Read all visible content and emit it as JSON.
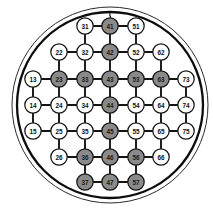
{
  "figure": {
    "name": "wafer-site-map",
    "background_color": "#ffffff",
    "wafer": {
      "center_x": 110,
      "center_y": 105,
      "outer_radius": 98,
      "inner_radius": 93,
      "outer_stroke_color": "#2b2b2b",
      "inner_stroke_color": "#0d0d0d"
    },
    "colors": {
      "node_highlight_fill": "#8a8a8a",
      "node_plain_fill": "#ffffff",
      "node_stroke": "#141414",
      "edge_stroke": "#141414",
      "label_color": "#111111"
    },
    "node_radius": 8.2,
    "grid": {
      "columns_x": [
        33,
        59,
        85,
        110,
        136,
        161,
        186
      ],
      "rows_y": [
        26,
        52,
        79,
        105,
        131,
        157,
        182
      ]
    },
    "notch": {
      "x": 110,
      "y_top": 11,
      "y_bottom": 22
    }
  },
  "chart_data": {
    "type": "scatter",
    "title": "",
    "xlabel": "",
    "ylabel": "",
    "legend": [
      {
        "label": "shaded site",
        "fill": "#8a8a8a"
      },
      {
        "label": "unshaded site",
        "fill": "#ffffff"
      }
    ],
    "columns": [
      1,
      2,
      3,
      4,
      5,
      6,
      7
    ],
    "rows": [
      1,
      2,
      3,
      4,
      5,
      6,
      7
    ],
    "nodes": [
      {
        "id": "31",
        "col": 3,
        "row": 1,
        "x": 85,
        "y": 26,
        "shaded": false
      },
      {
        "id": "41",
        "col": 4,
        "row": 1,
        "x": 110,
        "y": 26,
        "shaded": true
      },
      {
        "id": "51",
        "col": 5,
        "row": 1,
        "x": 136,
        "y": 26,
        "shaded": false
      },
      {
        "id": "22",
        "col": 2,
        "row": 2,
        "x": 59,
        "y": 52,
        "shaded": false
      },
      {
        "id": "32",
        "col": 3,
        "row": 2,
        "x": 85,
        "y": 52,
        "shaded": false
      },
      {
        "id": "42",
        "col": 4,
        "row": 2,
        "x": 110,
        "y": 52,
        "shaded": true
      },
      {
        "id": "52",
        "col": 5,
        "row": 2,
        "x": 136,
        "y": 52,
        "shaded": false
      },
      {
        "id": "62",
        "col": 6,
        "row": 2,
        "x": 161,
        "y": 52,
        "shaded": false
      },
      {
        "id": "13",
        "col": 1,
        "row": 3,
        "x": 33,
        "y": 79,
        "shaded": false
      },
      {
        "id": "23",
        "col": 2,
        "row": 3,
        "x": 59,
        "y": 79,
        "shaded": true
      },
      {
        "id": "33",
        "col": 3,
        "row": 3,
        "x": 85,
        "y": 79,
        "shaded": true
      },
      {
        "id": "43",
        "col": 4,
        "row": 3,
        "x": 110,
        "y": 79,
        "shaded": true
      },
      {
        "id": "53",
        "col": 5,
        "row": 3,
        "x": 136,
        "y": 79,
        "shaded": true
      },
      {
        "id": "63",
        "col": 6,
        "row": 3,
        "x": 161,
        "y": 79,
        "shaded": true
      },
      {
        "id": "73",
        "col": 7,
        "row": 3,
        "x": 186,
        "y": 79,
        "shaded": false
      },
      {
        "id": "14",
        "col": 1,
        "row": 4,
        "x": 33,
        "y": 105,
        "shaded": false
      },
      {
        "id": "24",
        "col": 2,
        "row": 4,
        "x": 59,
        "y": 105,
        "shaded": false
      },
      {
        "id": "34",
        "col": 3,
        "row": 4,
        "x": 85,
        "y": 105,
        "shaded": false
      },
      {
        "id": "44",
        "col": 4,
        "row": 4,
        "x": 110,
        "y": 105,
        "shaded": true
      },
      {
        "id": "54",
        "col": 5,
        "row": 4,
        "x": 136,
        "y": 105,
        "shaded": false
      },
      {
        "id": "64",
        "col": 6,
        "row": 4,
        "x": 161,
        "y": 105,
        "shaded": false
      },
      {
        "id": "74",
        "col": 7,
        "row": 4,
        "x": 186,
        "y": 105,
        "shaded": false
      },
      {
        "id": "15",
        "col": 1,
        "row": 5,
        "x": 33,
        "y": 131,
        "shaded": false
      },
      {
        "id": "25",
        "col": 2,
        "row": 5,
        "x": 59,
        "y": 131,
        "shaded": false
      },
      {
        "id": "35",
        "col": 3,
        "row": 5,
        "x": 85,
        "y": 131,
        "shaded": false
      },
      {
        "id": "45",
        "col": 4,
        "row": 5,
        "x": 110,
        "y": 131,
        "shaded": true
      },
      {
        "id": "55",
        "col": 5,
        "row": 5,
        "x": 136,
        "y": 131,
        "shaded": false
      },
      {
        "id": "65",
        "col": 6,
        "row": 5,
        "x": 161,
        "y": 131,
        "shaded": false
      },
      {
        "id": "75",
        "col": 7,
        "row": 5,
        "x": 186,
        "y": 131,
        "shaded": false
      },
      {
        "id": "26",
        "col": 2,
        "row": 6,
        "x": 59,
        "y": 157,
        "shaded": false
      },
      {
        "id": "36",
        "col": 3,
        "row": 6,
        "x": 85,
        "y": 157,
        "shaded": true
      },
      {
        "id": "46",
        "col": 4,
        "row": 6,
        "x": 110,
        "y": 157,
        "shaded": true
      },
      {
        "id": "56",
        "col": 5,
        "row": 6,
        "x": 136,
        "y": 157,
        "shaded": true
      },
      {
        "id": "66",
        "col": 6,
        "row": 6,
        "x": 161,
        "y": 157,
        "shaded": false
      },
      {
        "id": "37",
        "col": 3,
        "row": 7,
        "x": 85,
        "y": 182,
        "shaded": true
      },
      {
        "id": "47",
        "col": 4,
        "row": 7,
        "x": 110,
        "y": 182,
        "shaded": true
      },
      {
        "id": "57",
        "col": 5,
        "row": 7,
        "x": 136,
        "y": 182,
        "shaded": true
      }
    ],
    "edges": [
      [
        "31",
        "41"
      ],
      [
        "41",
        "51"
      ],
      [
        "22",
        "32"
      ],
      [
        "32",
        "42"
      ],
      [
        "42",
        "52"
      ],
      [
        "52",
        "62"
      ],
      [
        "13",
        "23"
      ],
      [
        "23",
        "33"
      ],
      [
        "33",
        "43"
      ],
      [
        "43",
        "53"
      ],
      [
        "53",
        "63"
      ],
      [
        "63",
        "73"
      ],
      [
        "14",
        "24"
      ],
      [
        "24",
        "34"
      ],
      [
        "34",
        "44"
      ],
      [
        "44",
        "54"
      ],
      [
        "54",
        "64"
      ],
      [
        "64",
        "74"
      ],
      [
        "15",
        "25"
      ],
      [
        "25",
        "35"
      ],
      [
        "35",
        "45"
      ],
      [
        "45",
        "55"
      ],
      [
        "55",
        "65"
      ],
      [
        "65",
        "75"
      ],
      [
        "26",
        "36"
      ],
      [
        "36",
        "46"
      ],
      [
        "46",
        "56"
      ],
      [
        "56",
        "66"
      ],
      [
        "37",
        "47"
      ],
      [
        "47",
        "57"
      ],
      [
        "31",
        "32"
      ],
      [
        "32",
        "33"
      ],
      [
        "33",
        "34"
      ],
      [
        "34",
        "35"
      ],
      [
        "35",
        "36"
      ],
      [
        "36",
        "37"
      ],
      [
        "41",
        "42"
      ],
      [
        "42",
        "43"
      ],
      [
        "43",
        "44"
      ],
      [
        "44",
        "45"
      ],
      [
        "45",
        "46"
      ],
      [
        "46",
        "47"
      ],
      [
        "51",
        "52"
      ],
      [
        "52",
        "53"
      ],
      [
        "53",
        "54"
      ],
      [
        "54",
        "55"
      ],
      [
        "55",
        "56"
      ],
      [
        "56",
        "57"
      ],
      [
        "22",
        "23"
      ],
      [
        "23",
        "24"
      ],
      [
        "24",
        "25"
      ],
      [
        "25",
        "26"
      ],
      [
        "62",
        "63"
      ],
      [
        "63",
        "64"
      ],
      [
        "64",
        "65"
      ],
      [
        "65",
        "66"
      ],
      [
        "13",
        "14"
      ],
      [
        "14",
        "15"
      ],
      [
        "73",
        "74"
      ],
      [
        "74",
        "75"
      ]
    ]
  }
}
